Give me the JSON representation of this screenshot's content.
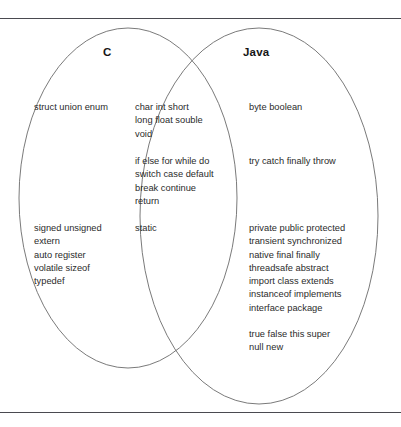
{
  "figure": {
    "type": "venn-diagram",
    "sets": [
      "C",
      "Java"
    ],
    "stroke_color": "#6b6b6b",
    "rule_color": "#4a4a50",
    "text_color": "#2b2b2b"
  },
  "headings": {
    "left": "C",
    "right": "Java"
  },
  "regions": {
    "c_only": [
      {
        "id": "c-types",
        "lines": [
          "struct union enum"
        ]
      },
      {
        "id": "c-storage",
        "lines": [
          "signed unsigned",
          "extern",
          "auto register",
          "volatile sizeof",
          "typedef"
        ]
      }
    ],
    "shared": [
      {
        "id": "shared-types",
        "lines": [
          "char  int  short",
          "long  float  souble",
          "void"
        ]
      },
      {
        "id": "shared-flow",
        "lines": [
          "if else for while do",
          "switch case default",
          "break continue",
          "return"
        ]
      },
      {
        "id": "shared-static",
        "lines": [
          "static"
        ]
      }
    ],
    "java_only": [
      {
        "id": "java-types",
        "lines": [
          "byte boolean"
        ]
      },
      {
        "id": "java-exc",
        "lines": [
          "try catch finally throw"
        ]
      },
      {
        "id": "java-mod",
        "lines": [
          "private public protected",
          "transient synchronized",
          "native final finally",
          "threadsafe abstract"
        ]
      },
      {
        "id": "java-decl",
        "lines": [
          "import class extends",
          "instanceof implements",
          "interface package"
        ]
      },
      {
        "id": "java-literals",
        "lines": [
          "true false this super",
          "null new"
        ]
      }
    ]
  }
}
